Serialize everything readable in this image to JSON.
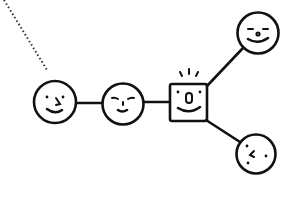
{
  "diagram": {
    "type": "network-graph",
    "style": "hand-drawn doodle",
    "colors": {
      "ink": "#111111",
      "background": "#ffffff"
    },
    "dotted_edge": {
      "from": [
        4,
        0
      ],
      "to": [
        47,
        70
      ]
    },
    "nodes": [
      {
        "id": "face-left",
        "shape": "circle",
        "expression": "smiling with dot eyes",
        "cx": 55,
        "cy": 102,
        "r": 22
      },
      {
        "id": "face-middle",
        "shape": "circle",
        "expression": "content with closed eyes",
        "cx": 123,
        "cy": 104,
        "r": 21
      },
      {
        "id": "hub-square",
        "shape": "square",
        "expression": "excited with open mouth",
        "x": 169,
        "y": 84,
        "w": 39,
        "h": 38
      },
      {
        "id": "face-top-right",
        "shape": "circle",
        "expression": "content with closed eyes",
        "cx": 258,
        "cy": 33,
        "r": 21
      },
      {
        "id": "face-bottom-right",
        "shape": "circle",
        "expression": "sideways face",
        "cx": 256,
        "cy": 154,
        "r": 20
      }
    ],
    "edges": [
      {
        "from": "face-left",
        "to": "face-middle"
      },
      {
        "from": "face-middle",
        "to": "hub-square"
      },
      {
        "from": "hub-square",
        "to": "face-top-right"
      },
      {
        "from": "hub-square",
        "to": "face-bottom-right"
      }
    ]
  }
}
